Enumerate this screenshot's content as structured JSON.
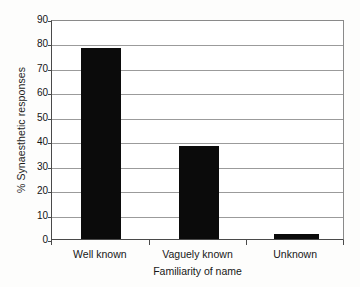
{
  "chart_data": {
    "type": "bar",
    "title": "",
    "subtitle": "",
    "categories": [
      "Well known",
      "Vaguely known",
      "Unknown"
    ],
    "values": [
      78,
      38,
      2
    ],
    "series": [
      {
        "name": "% Synaesthetic responses",
        "values": [
          78,
          38,
          2
        ]
      }
    ],
    "xlabel": "Familiarity of name",
    "ylabel": "% Synaesthetic responses",
    "ylim": [
      0,
      90
    ],
    "ytick_values": [
      0,
      10,
      20,
      30,
      40,
      50,
      60,
      70,
      80,
      90
    ],
    "ytick_labels": [
      "0",
      "10",
      "20",
      "30",
      "40",
      "50",
      "60",
      "70",
      "80",
      "90"
    ],
    "ytick_step": 10,
    "grid": "horizontal",
    "legend": "none",
    "bar_color": "#0b0b0b",
    "grid_color": "#9b9b9b",
    "axis_color": "#4a4a4a",
    "background_color": "#ffffff",
    "annotations": []
  }
}
